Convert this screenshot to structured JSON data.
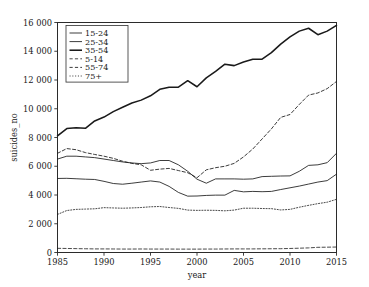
{
  "chart_data": {
    "type": "line",
    "title": "",
    "xlabel": "year",
    "ylabel": "suicides_no",
    "xlim": [
      1985,
      2015
    ],
    "ylim": [
      0,
      16000
    ],
    "grid": false,
    "legend_position": "top-left",
    "xticks": [
      1985,
      1990,
      1995,
      2000,
      2005,
      2010,
      2015
    ],
    "xtick_labels": [
      "1985",
      "1990",
      "1995",
      "2000",
      "2005",
      "2010",
      "2015"
    ],
    "yticks": [
      0,
      2000,
      4000,
      6000,
      8000,
      10000,
      12000,
      14000,
      16000
    ],
    "ytick_labels": [
      "0",
      "2 000",
      "4 000",
      "6 000",
      "8 000",
      "10 000",
      "12 000",
      "14 000",
      "16 000"
    ],
    "x": [
      1985,
      1986,
      1987,
      1988,
      1989,
      1990,
      1991,
      1992,
      1993,
      1994,
      1995,
      1996,
      1997,
      1998,
      1999,
      2000,
      2001,
      2002,
      2003,
      2004,
      2005,
      2006,
      2007,
      2008,
      2009,
      2010,
      2011,
      2012,
      2013,
      2014,
      2015
    ],
    "series": [
      {
        "name": "15-24",
        "linestyle": "solid",
        "linewidth": "normal",
        "color": "#1a1a1a",
        "values": [
          5150,
          5160,
          5130,
          5100,
          5080,
          4950,
          4800,
          4750,
          4820,
          4900,
          4980,
          4900,
          4600,
          4180,
          3920,
          3930,
          3970,
          3990,
          3990,
          4320,
          4220,
          4250,
          4230,
          4250,
          4380,
          4500,
          4620,
          4760,
          4900,
          5000,
          5450
        ]
      },
      {
        "name": "25-34",
        "linestyle": "solid",
        "linewidth": "normal",
        "color": "#1a1a1a",
        "values": [
          6500,
          6700,
          6700,
          6650,
          6600,
          6500,
          6400,
          6300,
          6230,
          6180,
          6230,
          6400,
          6400,
          6100,
          5650,
          5100,
          4820,
          5120,
          5120,
          5120,
          5100,
          5120,
          5280,
          5300,
          5320,
          5330,
          5650,
          6060,
          6100,
          6250,
          6900
        ]
      },
      {
        "name": "35-54",
        "linestyle": "solid",
        "linewidth": "thick",
        "color": "#1a1a1a",
        "values": [
          8120,
          8620,
          8680,
          8640,
          9150,
          9420,
          9800,
          10100,
          10400,
          10600,
          10900,
          11350,
          11500,
          11500,
          11950,
          11530,
          12150,
          12600,
          13100,
          13000,
          13250,
          13450,
          13450,
          13900,
          14500,
          15000,
          15400,
          15600,
          15150,
          15400,
          15800
        ]
      },
      {
        "name": "5-14",
        "linestyle": "dashed",
        "linewidth": "thin",
        "color": "#1a1a1a",
        "values": [
          290,
          280,
          270,
          260,
          250,
          250,
          245,
          240,
          240,
          245,
          240,
          240,
          240,
          235,
          235,
          235,
          240,
          240,
          245,
          250,
          250,
          250,
          255,
          260,
          265,
          280,
          300,
          320,
          360,
          370,
          380
        ]
      },
      {
        "name": "55-74",
        "linestyle": "dashed",
        "linewidth": "normal",
        "color": "#1a1a1a",
        "values": [
          6900,
          7230,
          7150,
          6950,
          6820,
          6700,
          6550,
          6350,
          6200,
          6100,
          5720,
          5800,
          5850,
          5700,
          5550,
          5200,
          5750,
          5900,
          6000,
          6200,
          6650,
          7200,
          7900,
          8600,
          9400,
          9600,
          10300,
          10950,
          11100,
          11400,
          11900
        ]
      },
      {
        "name": "75+",
        "linestyle": "dotted",
        "linewidth": "thin",
        "color": "#1a1a1a",
        "values": [
          2650,
          2920,
          3000,
          3020,
          3040,
          3120,
          3100,
          3080,
          3100,
          3130,
          3180,
          3200,
          3130,
          3070,
          2950,
          2930,
          2940,
          2930,
          2900,
          2950,
          3080,
          3080,
          3060,
          3050,
          2960,
          3000,
          3150,
          3280,
          3400,
          3500,
          3700
        ]
      }
    ]
  },
  "legend": {
    "entries": [
      {
        "label": "15-24"
      },
      {
        "label": "25-34"
      },
      {
        "label": "35-54"
      },
      {
        "label": "5-14"
      },
      {
        "label": "55-74"
      },
      {
        "label": "75+"
      }
    ]
  }
}
